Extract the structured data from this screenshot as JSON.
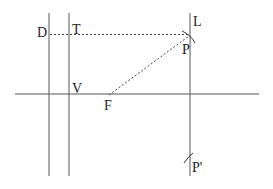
{
  "diagram": {
    "labels": {
      "D": "D",
      "T": "T",
      "L": "L",
      "P": "P",
      "V": "V",
      "F": "F",
      "P_prime": "P'"
    },
    "colors": {
      "line": "#555555",
      "text": "#222222",
      "background": "#ffffff"
    }
  }
}
